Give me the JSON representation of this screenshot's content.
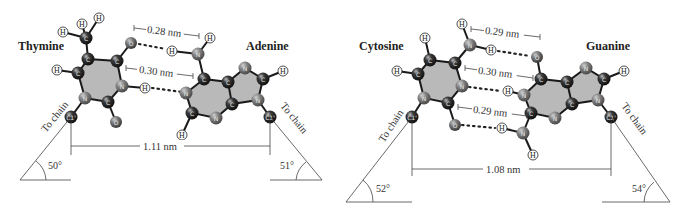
{
  "colors": {
    "ring_fill": "#b9b9b9",
    "carbon": "#2b2b2b",
    "nitrogen": "#7a7a7a",
    "oxygen": "#6e6e6e",
    "hydrogen_fill": "#ffffff",
    "bond": "#1a1a1a",
    "line": "#444444"
  },
  "left_pair": {
    "base1": "Thymine",
    "base2": "Adenine",
    "hbond_top": "0.28 nm",
    "hbond_mid": "0.30 nm",
    "c1_distance": "1.11 nm",
    "angle_left": "50°",
    "angle_right": "51°",
    "chain_left": "To chain",
    "chain_right": "To chain"
  },
  "right_pair": {
    "base1": "Cytosine",
    "base2": "Guanine",
    "hbond_top": "0.29 nm",
    "hbond_mid": "0.30 nm",
    "hbond_bottom": "0.29 nm",
    "c1_distance": "1.08 nm",
    "angle_left": "52°",
    "angle_right": "54°",
    "chain_left": "To chain",
    "chain_right": "To chain"
  },
  "atoms": {
    "C": "C",
    "N": "N",
    "O": "O",
    "H": "H",
    "C1": "C1'"
  }
}
